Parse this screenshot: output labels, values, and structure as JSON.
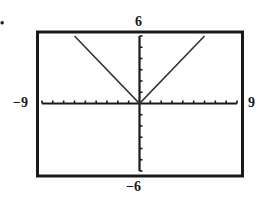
{
  "chart_data": {
    "type": "line",
    "title": "",
    "function": "y = |x|",
    "xlabel": "",
    "ylabel": "",
    "xlim": [
      -9,
      9
    ],
    "ylim": [
      -6,
      6
    ],
    "xscale": 1,
    "yscale": 1,
    "grid": false,
    "series": [
      {
        "name": "y=|x|",
        "x": [
          -6,
          0,
          6
        ],
        "y": [
          6,
          0,
          6
        ]
      }
    ],
    "tick_labels": {
      "xmin": "−9",
      "xmax": "9",
      "ymin": "−6",
      "ymax": "6"
    }
  },
  "marker": "•"
}
